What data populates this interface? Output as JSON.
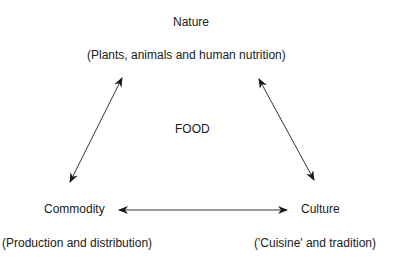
{
  "diagram": {
    "center": "FOOD",
    "nodes": {
      "nature": {
        "title": "Nature",
        "subtitle": "(Plants, animals and human nutrition)"
      },
      "commodity": {
        "title": "Commodity",
        "subtitle": "(Production and distribution)"
      },
      "culture": {
        "title": "Culture",
        "subtitle": "('Cuisine' and tradition)"
      }
    },
    "edges": [
      {
        "from": "nature",
        "to": "commodity",
        "type": "bidirectional"
      },
      {
        "from": "nature",
        "to": "culture",
        "type": "bidirectional"
      },
      {
        "from": "commodity",
        "to": "culture",
        "type": "bidirectional"
      }
    ]
  }
}
